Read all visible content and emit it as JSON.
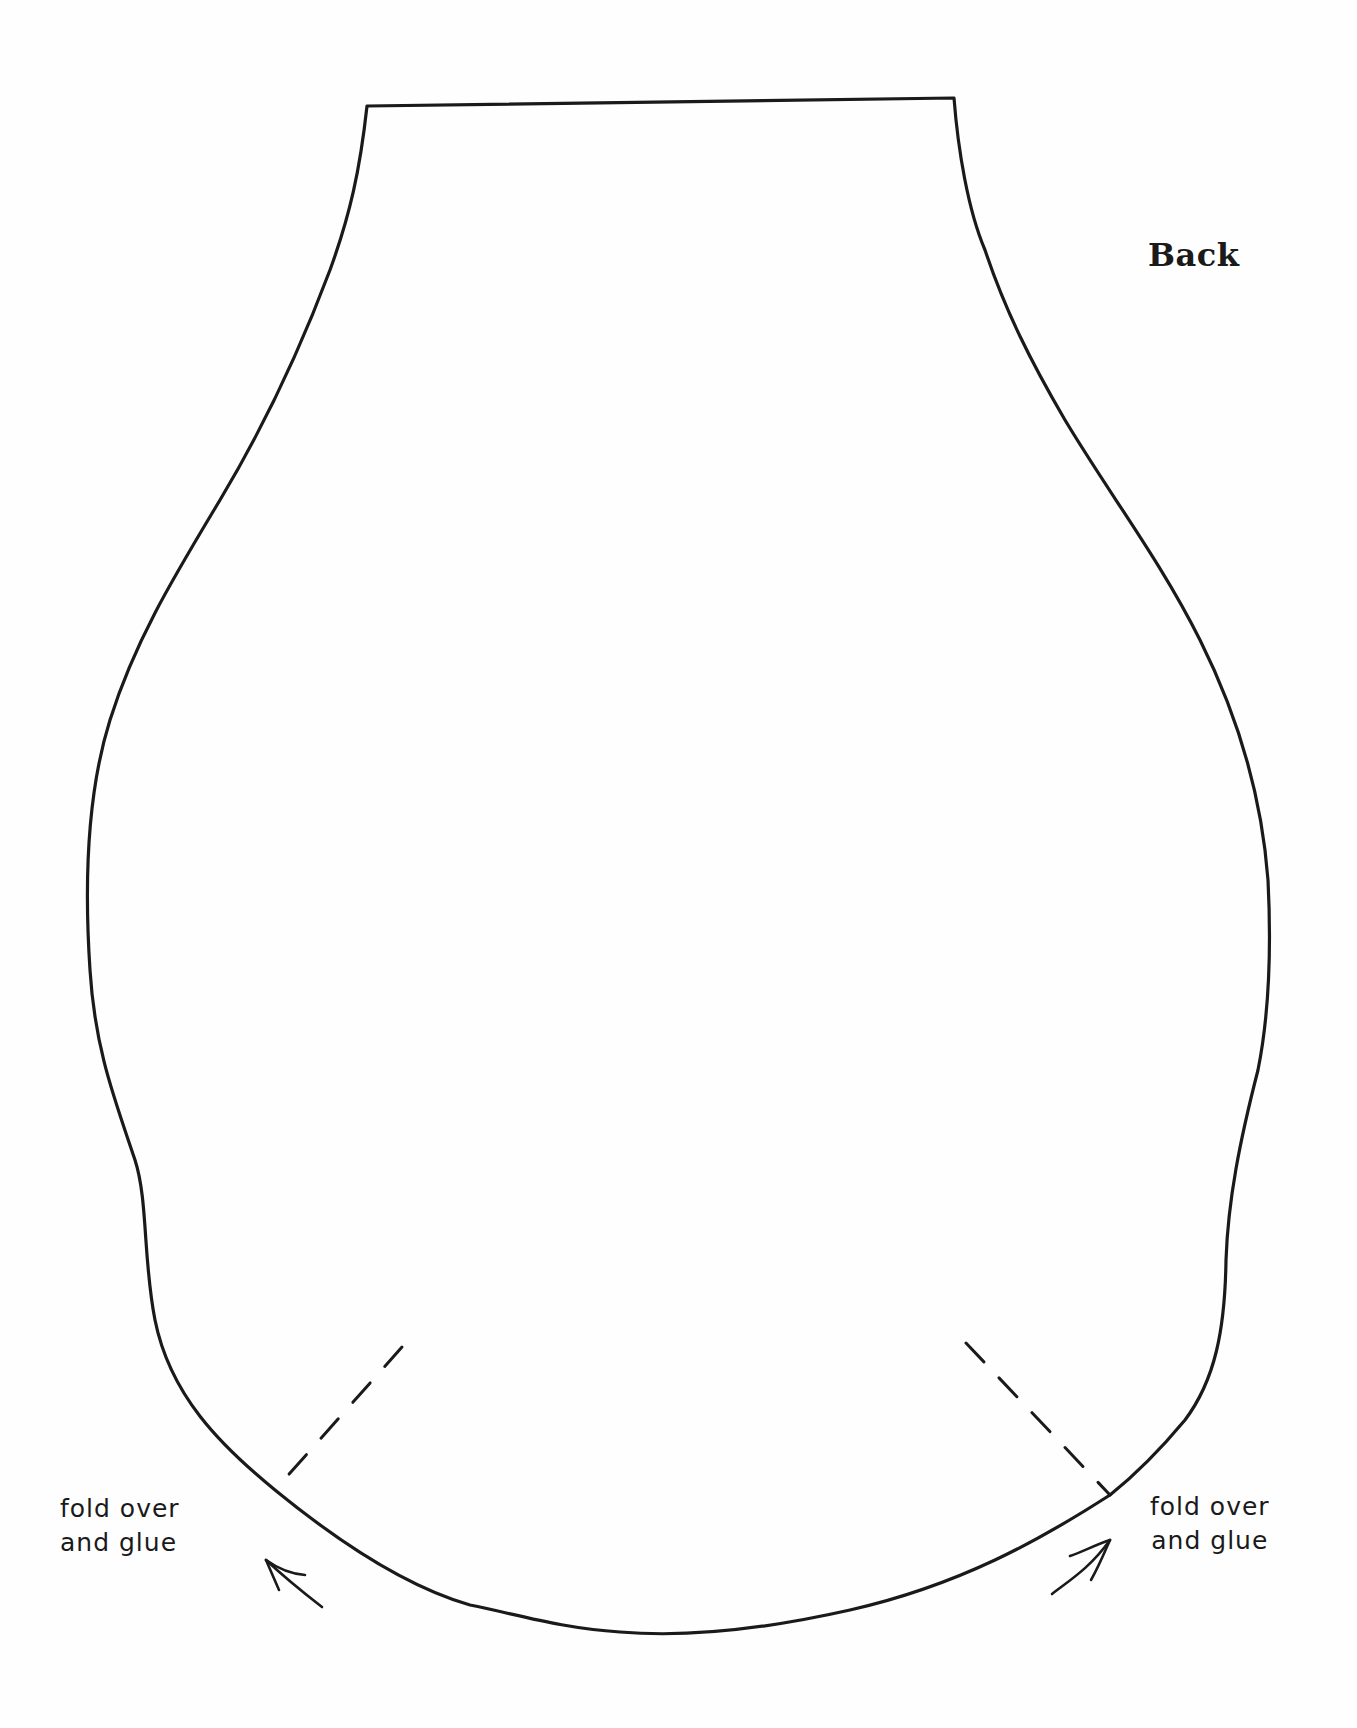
{
  "template": {
    "title": "Back",
    "left_note": {
      "line1": "fold over",
      "line2": "and glue"
    },
    "right_note": {
      "line1": "fold over",
      "line2": "and glue"
    },
    "elements": [
      "outline-shape",
      "left-fold-line-dashed",
      "right-fold-line-dashed",
      "left-fold-arrow",
      "right-fold-arrow"
    ]
  }
}
